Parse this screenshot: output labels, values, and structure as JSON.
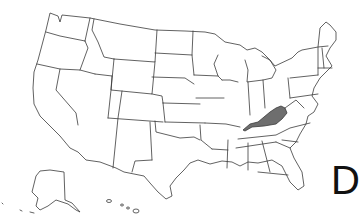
{
  "map": {
    "region": "United States",
    "highlighted_state": "Kentucky",
    "highlight_color": "#6e6e6e",
    "outline_color": "#3a3a3a",
    "background_color": "#ffffff",
    "insets": [
      "Alaska",
      "Hawaii"
    ]
  },
  "label": {
    "text": "D"
  }
}
